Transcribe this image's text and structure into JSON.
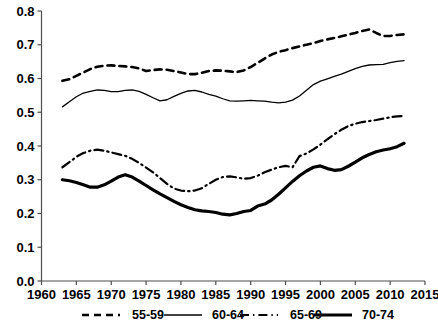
{
  "chart_data": {
    "type": "line",
    "title": "",
    "subtitle": "",
    "xlabel": "",
    "ylabel": "",
    "xlim": [
      1960,
      2015
    ],
    "ylim": [
      0.0,
      0.8
    ],
    "xticks": [
      1960,
      1965,
      1970,
      1975,
      1980,
      1985,
      1990,
      1995,
      2000,
      2005,
      2010,
      2015
    ],
    "yticks": [
      0.0,
      0.1,
      0.2,
      0.3,
      0.4,
      0.5,
      0.6,
      0.7,
      0.8
    ],
    "xtick_labels": [
      "1960",
      "1965",
      "1970",
      "1975",
      "1980",
      "1985",
      "1990",
      "1995",
      "2000",
      "2005",
      "2010",
      "2015"
    ],
    "ytick_labels": [
      "0.0",
      "0.1",
      "0.2",
      "0.3",
      "0.4",
      "0.5",
      "0.6",
      "0.7",
      "0.8"
    ],
    "grid": false,
    "legend_position": "bottom",
    "x": [
      1963,
      1964,
      1965,
      1966,
      1967,
      1968,
      1969,
      1970,
      1971,
      1972,
      1973,
      1974,
      1975,
      1976,
      1977,
      1978,
      1979,
      1980,
      1981,
      1982,
      1983,
      1984,
      1985,
      1986,
      1987,
      1988,
      1989,
      1990,
      1991,
      1992,
      1993,
      1994,
      1995,
      1996,
      1997,
      1998,
      1999,
      2000,
      2001,
      2002,
      2003,
      2004,
      2005,
      2006,
      2007,
      2008,
      2009,
      2010,
      2011,
      2012
    ],
    "series": [
      {
        "name": "55-59",
        "style": "dashed",
        "color": "#000000",
        "width": 2.6,
        "values": [
          0.593,
          0.598,
          0.608,
          0.618,
          0.628,
          0.635,
          0.638,
          0.639,
          0.637,
          0.636,
          0.634,
          0.63,
          0.622,
          0.625,
          0.627,
          0.626,
          0.622,
          0.618,
          0.613,
          0.613,
          0.617,
          0.622,
          0.624,
          0.623,
          0.621,
          0.619,
          0.624,
          0.634,
          0.646,
          0.659,
          0.671,
          0.679,
          0.684,
          0.69,
          0.695,
          0.7,
          0.705,
          0.711,
          0.716,
          0.72,
          0.725,
          0.73,
          0.735,
          0.741,
          0.745,
          0.735,
          0.726,
          0.726,
          0.729,
          0.731
        ]
      },
      {
        "name": "60-64",
        "style": "solid-thin",
        "color": "#000000",
        "width": 1.3,
        "values": [
          0.516,
          0.531,
          0.546,
          0.557,
          0.562,
          0.566,
          0.565,
          0.561,
          0.561,
          0.565,
          0.566,
          0.562,
          0.553,
          0.543,
          0.534,
          0.537,
          0.547,
          0.556,
          0.563,
          0.565,
          0.56,
          0.553,
          0.548,
          0.54,
          0.534,
          0.533,
          0.534,
          0.535,
          0.534,
          0.533,
          0.53,
          0.528,
          0.53,
          0.536,
          0.548,
          0.565,
          0.582,
          0.592,
          0.599,
          0.606,
          0.613,
          0.621,
          0.629,
          0.636,
          0.64,
          0.641,
          0.642,
          0.647,
          0.651,
          0.653
        ]
      },
      {
        "name": "65-69",
        "style": "dash-dot",
        "color": "#000000",
        "width": 2.2,
        "values": [
          0.337,
          0.352,
          0.368,
          0.379,
          0.386,
          0.389,
          0.386,
          0.381,
          0.376,
          0.371,
          0.362,
          0.35,
          0.336,
          0.322,
          0.305,
          0.288,
          0.274,
          0.268,
          0.266,
          0.268,
          0.275,
          0.288,
          0.3,
          0.308,
          0.31,
          0.307,
          0.303,
          0.305,
          0.312,
          0.322,
          0.33,
          0.337,
          0.341,
          0.337,
          0.328,
          0.318,
          0.311,
          0.311,
          0.313,
          0.318,
          0.326,
          0.334,
          0.341,
          0.339,
          0.336,
          0.34,
          0.348,
          0.356,
          0.362,
          0.366
        ]
      },
      {
        "name": "70-74",
        "style": "solid-thick",
        "color": "#000000",
        "width": 3.2,
        "values": [
          0.3,
          0.297,
          0.292,
          0.285,
          0.278,
          0.278,
          0.285,
          0.296,
          0.308,
          0.315,
          0.308,
          0.296,
          0.283,
          0.27,
          0.258,
          0.247,
          0.236,
          0.226,
          0.218,
          0.211,
          0.208,
          0.206,
          0.203,
          0.198,
          0.196,
          0.2,
          0.206,
          0.209,
          0.205,
          0.2,
          0.196,
          0.194,
          0.193,
          0.19,
          0.187,
          0.194,
          0.215,
          0.24,
          0.262,
          0.268,
          0.257,
          0.243,
          0.232,
          0.228,
          0.226,
          0.224,
          0.221,
          0.218,
          0.216,
          0.218
        ]
      }
    ],
    "series_alt_tail": {
      "65-69": [
        0.37,
        0.378,
        0.39,
        0.404,
        0.42,
        0.435,
        0.448,
        0.459,
        0.466,
        0.471,
        0.474,
        0.477,
        0.481,
        0.485,
        0.488,
        0.489
      ],
      "70-74": [
        0.222,
        0.228,
        0.24,
        0.257,
        0.276,
        0.295,
        0.312,
        0.326,
        0.337,
        0.341,
        0.333,
        0.328,
        0.33,
        0.34,
        0.352,
        0.365,
        0.375,
        0.383,
        0.388,
        0.392,
        0.398,
        0.408
      ]
    },
    "legend": [
      {
        "label": "55-59",
        "style": "dashed",
        "color": "#000000",
        "width": 2.6
      },
      {
        "label": "60-64",
        "style": "solid-thin",
        "color": "#000000",
        "width": 1.3
      },
      {
        "label": "65-69",
        "style": "dash-dot",
        "color": "#000000",
        "width": 2.2
      },
      {
        "label": "70-74",
        "style": "solid-thick",
        "color": "#000000",
        "width": 3.2
      }
    ]
  }
}
